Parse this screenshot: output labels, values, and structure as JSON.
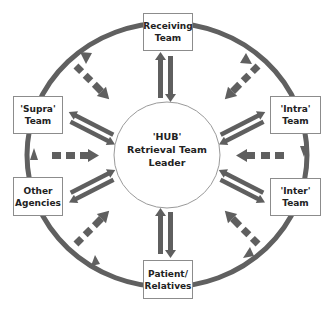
{
  "diagram": {
    "type": "hub-and-spoke",
    "hub": {
      "label": "'HUB'\nRetrieval Team\nLeader"
    },
    "nodes": [
      {
        "id": "receiving",
        "label": "Receiving\nTeam",
        "position": "top"
      },
      {
        "id": "intra",
        "label": "'Intra'\nTeam",
        "position": "upper-right"
      },
      {
        "id": "inter",
        "label": "'Inter'\nTeam",
        "position": "lower-right"
      },
      {
        "id": "patient",
        "label": "Patient/\nRelatives",
        "position": "bottom"
      },
      {
        "id": "other",
        "label": "Other\nAgencies",
        "position": "lower-left"
      },
      {
        "id": "supra",
        "label": "'Supra'\nTeam",
        "position": "upper-left"
      }
    ],
    "edges": {
      "solid_bidirectional": [
        "receiving-hub",
        "intra-hub",
        "inter-hub",
        "patient-hub",
        "other-hub",
        "supra-hub"
      ],
      "dashed_inward": [
        "top-left-gap",
        "top-right-gap",
        "right-gap",
        "bottom-right-gap",
        "bottom-left-gap",
        "left-gap"
      ],
      "outer_ring": "clockwise cycle connecting all nodes"
    },
    "colors": {
      "arrow": "#5f5f5f",
      "ring": "#606060",
      "box_border": "#8c8c8c",
      "hub_border": "#9a9a9a",
      "text": "#222222"
    }
  }
}
